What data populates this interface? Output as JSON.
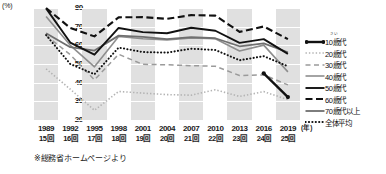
{
  "axis": {
    "y_unit_label": "(%)",
    "y_ticks": [
      "80",
      "70",
      "60",
      "50",
      "40",
      "30",
      "20"
    ],
    "x_unit_label": "(年)",
    "x_ticks": [
      {
        "year": "1989",
        "kai": "15回"
      },
      {
        "year": "1992",
        "kai": "16回"
      },
      {
        "year": "1995",
        "kai": "17回"
      },
      {
        "year": "1998",
        "kai": "18回"
      },
      {
        "year": "2001",
        "kai": "19回"
      },
      {
        "year": "2004",
        "kai": "20回"
      },
      {
        "year": "2007",
        "kai": "21回"
      },
      {
        "year": "2010",
        "kai": "22回"
      },
      {
        "year": "2013",
        "kai": "23回"
      },
      {
        "year": "2016",
        "kai": "24回"
      },
      {
        "year": "2019",
        "kai": "25回"
      }
    ]
  },
  "footnote": "※総務省ホームページより",
  "legend": [
    {
      "label": "10歳代",
      "ruby": "さい",
      "style": "solid-marker",
      "color": "#111111"
    },
    {
      "label": "20歳代",
      "ruby": "",
      "style": "fine-dotted",
      "color": "#b0b0b0"
    },
    {
      "label": "30歳代",
      "ruby": "",
      "style": "dashed",
      "color": "#9a9a9a"
    },
    {
      "label": "40歳代",
      "ruby": "",
      "style": "thin-solid",
      "color": "#8a8a8a"
    },
    {
      "label": "50歳代",
      "ruby": "",
      "style": "thick-solid",
      "color": "#111111"
    },
    {
      "label": "60歳代",
      "ruby": "",
      "style": "thick-dashed",
      "color": "#111111"
    },
    {
      "label": "70歳代以上",
      "ruby": "",
      "style": "medium-solid",
      "color": "#707070"
    },
    {
      "label": "全体平均",
      "ruby": "",
      "style": "bold-dotted",
      "color": "#111111"
    }
  ],
  "chart_data": {
    "type": "line",
    "title": "",
    "xlabel": "(年)",
    "ylabel": "(%)",
    "ylim": [
      20,
      80
    ],
    "grid": true,
    "legend_position": "right",
    "x": [
      "1989",
      "1992",
      "1995",
      "1998",
      "2001",
      "2004",
      "2007",
      "2010",
      "2013",
      "2016",
      "2019"
    ],
    "x_secondary": [
      "15回",
      "16回",
      "17回",
      "18回",
      "19回",
      "20回",
      "21回",
      "22回",
      "23回",
      "24回",
      "25回"
    ],
    "series": [
      {
        "name": "10歳代",
        "values": [
          null,
          null,
          null,
          null,
          null,
          null,
          null,
          null,
          null,
          45.0,
          32.3
        ]
      },
      {
        "name": "20歳代",
        "values": [
          47.4,
          36.5,
          25.2,
          35.3,
          34.4,
          33.6,
          33.3,
          36.2,
          32.6,
          35.2,
          30.9
        ]
      },
      {
        "name": "30歳代",
        "values": [
          65.3,
          55.0,
          41.5,
          55.2,
          49.8,
          49.6,
          49.1,
          48.8,
          43.8,
          44.2,
          38.8
        ]
      },
      {
        "name": "40歳代",
        "values": [
          75.5,
          60.0,
          48.5,
          64.7,
          63.5,
          62.9,
          64.0,
          63.5,
          57.0,
          60.1,
          45.8
        ]
      },
      {
        "name": "50歳代",
        "values": [
          79.8,
          61.5,
          55.0,
          69.3,
          67.1,
          66.5,
          69.4,
          67.8,
          61.3,
          63.3,
          55.4
        ]
      },
      {
        "name": "60歳代",
        "values": [
          80.0,
          69.3,
          64.8,
          75.0,
          75.1,
          74.2,
          76.2,
          75.9,
          67.2,
          70.1,
          63.3
        ]
      },
      {
        "name": "70歳代以上",
        "values": [
          66.5,
          59.0,
          57.2,
          65.2,
          64.5,
          63.3,
          64.4,
          63.8,
          59.5,
          61.0,
          56.3
        ]
      },
      {
        "name": "全体平均",
        "values": [
          65.5,
          50.0,
          44.5,
          58.8,
          56.4,
          56.1,
          58.2,
          57.5,
          52.0,
          54.2,
          48.8
        ]
      }
    ]
  }
}
